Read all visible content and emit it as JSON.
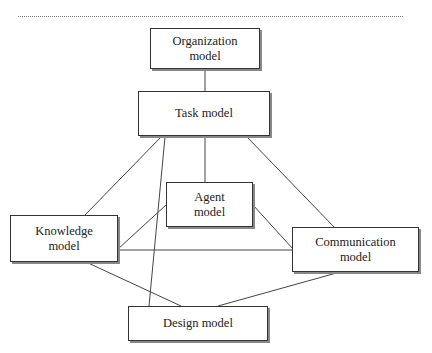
{
  "diagram": {
    "nodes": [
      {
        "id": "organization",
        "label": "Organization\nmodel",
        "line1": "Organization",
        "line2": "model"
      },
      {
        "id": "task",
        "label": "Task model",
        "line1": "Task model",
        "line2": ""
      },
      {
        "id": "agent",
        "label": "Agent\nmodel",
        "line1": "Agent",
        "line2": "model"
      },
      {
        "id": "knowledge",
        "label": "Knowledge\nmodel",
        "line1": "Knowledge",
        "line2": "model"
      },
      {
        "id": "communication",
        "label": "Communication\nmodel",
        "line1": "Communication",
        "line2": "model"
      },
      {
        "id": "design",
        "label": "Design model",
        "line1": "Design model",
        "line2": ""
      }
    ],
    "edges": [
      [
        "organization",
        "task"
      ],
      [
        "task",
        "agent"
      ],
      [
        "task",
        "knowledge"
      ],
      [
        "task",
        "design"
      ],
      [
        "task",
        "communication"
      ],
      [
        "agent",
        "knowledge"
      ],
      [
        "agent",
        "communication"
      ],
      [
        "knowledge",
        "communication"
      ],
      [
        "knowledge",
        "design"
      ],
      [
        "communication",
        "design"
      ]
    ]
  }
}
